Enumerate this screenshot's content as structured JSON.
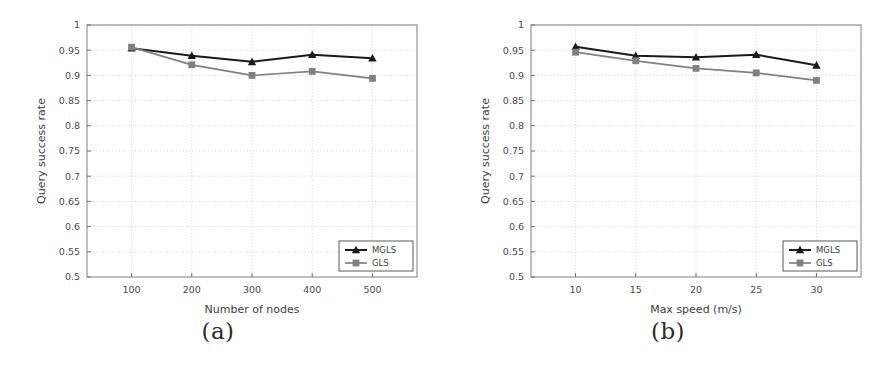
{
  "figure": {
    "panels": [
      {
        "caption": "(a)",
        "chart_data": {
          "type": "line",
          "title": "",
          "xlabel": "Number of nodes",
          "ylabel": "Query success rate",
          "x": [
            100,
            200,
            300,
            400,
            500
          ],
          "xticklabels": [
            "100",
            "200",
            "300",
            "400",
            "500"
          ],
          "yticklabels": [
            "0.5",
            "0.55",
            "0.6",
            "0.65",
            "0.7",
            "0.75",
            "0.8",
            "0.85",
            "0.9",
            "0.95",
            "1"
          ],
          "ylim": [
            0.5,
            1
          ],
          "ytick_step": 0.05,
          "grid": true,
          "legend_position": "lower-right",
          "series": [
            {
              "name": "MGLS",
              "color": "#1a1a1a",
              "marker": "triangle",
              "values": [
                0.954,
                0.939,
                0.927,
                0.941,
                0.934
              ]
            },
            {
              "name": "GLS",
              "color": "#808080",
              "marker": "square",
              "values": [
                0.956,
                0.921,
                0.9,
                0.908,
                0.894
              ]
            }
          ]
        }
      },
      {
        "caption": "(b)",
        "chart_data": {
          "type": "line",
          "title": "",
          "xlabel": "Max speed (m/s)",
          "ylabel": "Query success rate",
          "x": [
            10,
            15,
            20,
            25,
            30
          ],
          "xticklabels": [
            "10",
            "15",
            "20",
            "25",
            "30"
          ],
          "yticklabels": [
            "0.5",
            "0.55",
            "0.6",
            "0.65",
            "0.7",
            "0.75",
            "0.8",
            "0.85",
            "0.9",
            "0.95",
            "1"
          ],
          "ylim": [
            0.5,
            1
          ],
          "ytick_step": 0.05,
          "grid": true,
          "legend_position": "lower-right",
          "series": [
            {
              "name": "MGLS",
              "color": "#1a1a1a",
              "marker": "triangle",
              "values": [
                0.957,
                0.939,
                0.936,
                0.941,
                0.92
              ]
            },
            {
              "name": "GLS",
              "color": "#808080",
              "marker": "square",
              "values": [
                0.946,
                0.929,
                0.914,
                0.905,
                0.89
              ]
            }
          ]
        }
      }
    ]
  }
}
